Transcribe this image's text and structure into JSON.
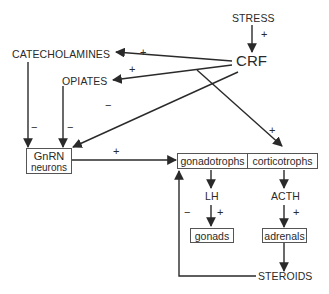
{
  "diagram": {
    "nodes": {
      "stress": "STRESS",
      "crf": "CRF",
      "catecholamines": "CATECHOLAMINES",
      "opiates": "OPIATES",
      "gnrn_line1": "GnRN",
      "gnrn_line2": "neurons",
      "gonadotrophs": "gonadotrophs",
      "corticotrophs": "corticotrophs",
      "lh": "LH",
      "acth": "ACTH",
      "gonads": "gonads",
      "adrenals": "adrenals",
      "steroids": "STEROIDS"
    },
    "edges": [
      {
        "from": "STRESS",
        "to": "CRF",
        "sign": "+"
      },
      {
        "from": "CRF",
        "to": "CATECHOLAMINES",
        "sign": "+"
      },
      {
        "from": "CRF",
        "to": "OPIATES",
        "sign": "+"
      },
      {
        "from": "CRF",
        "to": "GnRN neurons",
        "sign": "−"
      },
      {
        "from": "CRF",
        "to": "corticotrophs",
        "sign": "+"
      },
      {
        "from": "CATECHOLAMINES",
        "to": "GnRN neurons",
        "sign": "−"
      },
      {
        "from": "OPIATES",
        "to": "GnRN neurons",
        "sign": "−"
      },
      {
        "from": "GnRN neurons",
        "to": "gonadotrophs",
        "sign": "+"
      },
      {
        "from": "gonadotrophs",
        "to": "LH",
        "sign": ""
      },
      {
        "from": "LH",
        "to": "gonads",
        "sign": "+"
      },
      {
        "from": "corticotrophs",
        "to": "ACTH",
        "sign": ""
      },
      {
        "from": "ACTH",
        "to": "adrenals",
        "sign": "+"
      },
      {
        "from": "adrenals",
        "to": "STEROIDS",
        "sign": ""
      },
      {
        "from": "STEROIDS",
        "to": "gonadotrophs",
        "sign": "−"
      }
    ],
    "signs": {
      "plus": "+",
      "minus": "−"
    }
  }
}
